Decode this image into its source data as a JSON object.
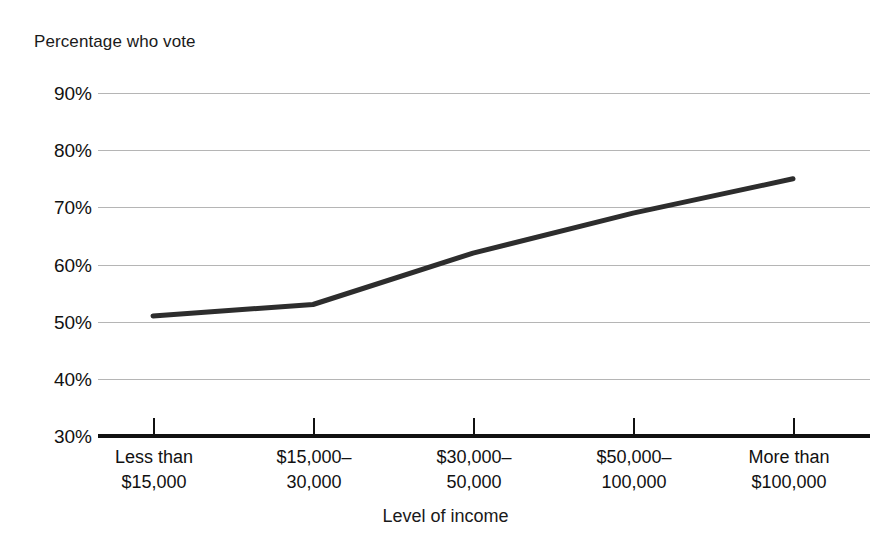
{
  "chart_data": {
    "type": "line",
    "title": "",
    "ylabel": "Percentage who vote",
    "xlabel": "Level of income",
    "categories": [
      "Less than $15,000",
      "$15,000–30,000",
      "$30,000–50,000",
      "$50,000–100,000",
      "More than $100,000"
    ],
    "category_lines": [
      [
        "Less than",
        "$15,000"
      ],
      [
        "$15,000–",
        "30,000"
      ],
      [
        "$30,000–",
        "50,000"
      ],
      [
        "$50,000–",
        "100,000"
      ],
      [
        "More than",
        "$100,000"
      ]
    ],
    "values": [
      51,
      53,
      62,
      69,
      75
    ],
    "series": [
      {
        "name": "Percentage who vote",
        "values": [
          51,
          53,
          62,
          69,
          75
        ]
      }
    ],
    "ylim": [
      30,
      90
    ],
    "ytick_values": [
      90,
      80,
      70,
      60,
      50,
      40,
      30
    ],
    "ytick_labels": [
      "90%",
      "80%",
      "70%",
      "60%",
      "50%",
      "40%",
      "30%"
    ],
    "grid": true,
    "legend": "none",
    "line_color": "#2d2d2d",
    "grid_color": "#b5b5b5",
    "axis_color": "#111111",
    "background": "#ffffff"
  }
}
